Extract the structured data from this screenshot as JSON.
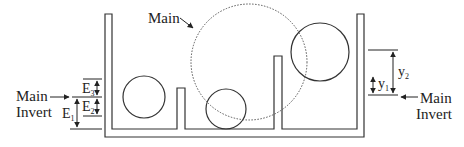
{
  "labels": {
    "main_top": "Main",
    "main_invert_left_line1": "Main",
    "main_invert_left_line2": "Invert",
    "main_invert_right_line1": "Main",
    "main_invert_right_line2": "Invert",
    "e1": "E",
    "e1_sub": "1",
    "e2": "E",
    "e2_sub": "2",
    "e3": "E",
    "e3_sub": "3",
    "y1": "y",
    "y1_sub": "1",
    "y2": "y",
    "y2_sub": "2"
  },
  "colors": {
    "stroke": "#333333",
    "dotted": "#555555",
    "background": "#ffffff"
  }
}
